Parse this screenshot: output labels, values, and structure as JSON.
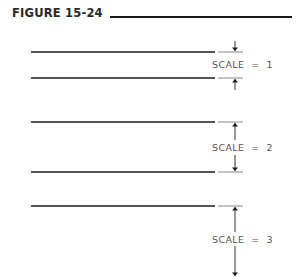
{
  "figure": {
    "title": "FIGURE 15-24"
  },
  "dimensions": [
    {
      "label": "SCALE  =  1",
      "scale": 1
    },
    {
      "label": "SCALE  =  2",
      "scale": 2
    },
    {
      "label": "SCALE  =  3",
      "scale": 3
    }
  ],
  "colors": {
    "line": "#1a1a1a",
    "extension": "#888888",
    "text": "#555555"
  }
}
